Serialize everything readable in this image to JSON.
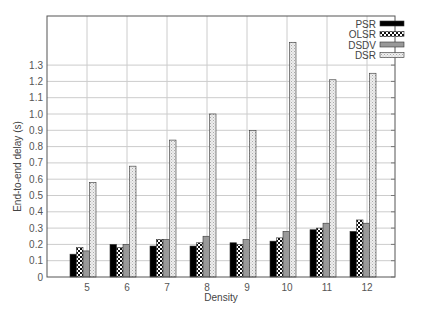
{
  "chart_data": {
    "type": "bar",
    "title": "",
    "xlabel": "Density",
    "ylabel": "End-to-end delay (s)",
    "categories": [
      "5",
      "6",
      "7",
      "8",
      "9",
      "10",
      "11",
      "12"
    ],
    "yticks": [
      "0",
      "0.1",
      "0.2",
      "0.3",
      "0.4",
      "0.5",
      "0.6",
      "0.7",
      "0.8",
      "0.9",
      "1.0",
      "1.1",
      "1.2",
      "1.3"
    ],
    "ylim": [
      0,
      1.6
    ],
    "grid": true,
    "legend_position": "top-right",
    "series": [
      {
        "name": "PSR",
        "pattern": "solid-black",
        "values": [
          0.14,
          0.2,
          0.19,
          0.19,
          0.21,
          0.22,
          0.29,
          0.28
        ]
      },
      {
        "name": "OLSR",
        "pattern": "checker",
        "values": [
          0.18,
          0.18,
          0.23,
          0.21,
          0.2,
          0.24,
          0.3,
          0.35
        ]
      },
      {
        "name": "DSDV",
        "pattern": "solid-gray",
        "values": [
          0.16,
          0.2,
          0.23,
          0.25,
          0.23,
          0.28,
          0.33,
          0.33
        ]
      },
      {
        "name": "DSR",
        "pattern": "light-dots",
        "values": [
          0.58,
          0.68,
          0.84,
          1.0,
          0.9,
          1.44,
          1.21,
          1.25
        ]
      }
    ]
  }
}
